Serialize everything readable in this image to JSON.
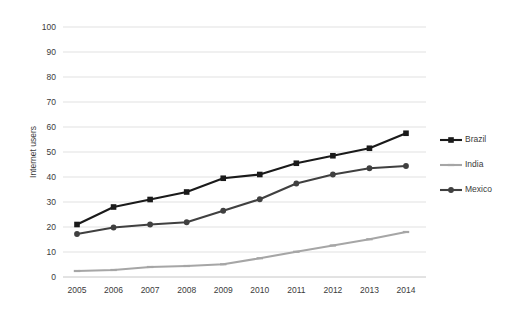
{
  "chart_data": {
    "type": "line",
    "title": "",
    "subtitle": "",
    "xlabel": "",
    "ylabel": "Internet users",
    "categories": [
      "2005",
      "2006",
      "2007",
      "2008",
      "2009",
      "2010",
      "2011",
      "2012",
      "2013",
      "2014"
    ],
    "x": [
      2005,
      2006,
      2007,
      2008,
      2009,
      2010,
      2011,
      2012,
      2013,
      2014
    ],
    "ylim": [
      0,
      100
    ],
    "yticks": [
      0,
      10,
      20,
      30,
      40,
      50,
      60,
      70,
      80,
      90,
      100
    ],
    "ytick_labels": [
      "0",
      "10",
      "20",
      "30",
      "40",
      "50",
      "60",
      "70",
      "80",
      "90",
      "100"
    ],
    "grid": true,
    "grid_axis": "y",
    "legend_position": "right",
    "series": [
      {
        "name": "Brazil",
        "color": "#1a1a1a",
        "marker": "square",
        "values": [
          21.0,
          28.0,
          31.0,
          34.0,
          39.5,
          41.0,
          45.5,
          48.5,
          51.5,
          57.5
        ]
      },
      {
        "name": "India",
        "color": "#a6a6a6",
        "marker": "dash",
        "values": [
          2.4,
          2.8,
          4.0,
          4.4,
          5.1,
          7.5,
          10.1,
          12.6,
          15.1,
          18.0
        ]
      },
      {
        "name": "Mexico",
        "color": "#404040",
        "marker": "circle",
        "values": [
          17.2,
          19.8,
          21.0,
          21.9,
          26.5,
          31.1,
          37.4,
          41.0,
          43.5,
          44.4
        ]
      }
    ]
  },
  "legend": {
    "items": [
      {
        "label": "Brazil"
      },
      {
        "label": "India"
      },
      {
        "label": "Mexico"
      }
    ]
  },
  "axes": {
    "y_title": "Internet users"
  }
}
